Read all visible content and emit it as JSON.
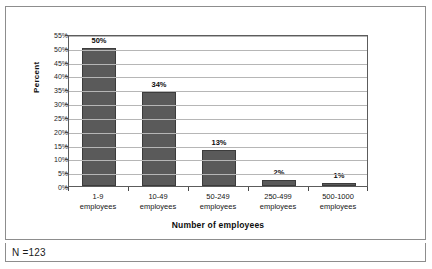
{
  "figure": {
    "clipped_caption_sliver": "",
    "footer_note": "N =123",
    "trailing_glyph": ""
  },
  "colors": {
    "bar_fill": "#5a5a5a",
    "bar_outline": "#3c3c3c",
    "gridline": "#b6b6b6",
    "axis": "#5c5c5c",
    "frame_border": "#8d8d8d",
    "text": "#0d0d0d",
    "plot_background": "#ffffff"
  },
  "chart_data": {
    "type": "bar",
    "title": "",
    "xlabel": "Number of employees",
    "ylabel": "Percent",
    "categories": [
      "1-9 employees",
      "10-49 employees",
      "50-249 employees",
      "250-499 employees",
      "500-1000 employees"
    ],
    "category_lines": [
      [
        "1-9",
        "employees"
      ],
      [
        "10-49",
        "employees"
      ],
      [
        "50-249",
        "employees"
      ],
      [
        "250-499",
        "employees"
      ],
      [
        "500-1000",
        "employees"
      ]
    ],
    "values": [
      50,
      34,
      13,
      2,
      1
    ],
    "data_labels": [
      "50%",
      "34%",
      "13%",
      "2%",
      "1%"
    ],
    "ylim": [
      0,
      55
    ],
    "ytick_values": [
      0,
      5,
      10,
      15,
      20,
      25,
      30,
      35,
      40,
      45,
      50,
      55
    ],
    "ytick_labels": [
      "0%",
      "5%",
      "10%",
      "15%",
      "20%",
      "25%",
      "30%",
      "35%",
      "40%",
      "45%",
      "50%",
      "55%"
    ],
    "grid": true,
    "grid_axis": "y",
    "legend": false,
    "legend_position": "none",
    "n": 123
  }
}
